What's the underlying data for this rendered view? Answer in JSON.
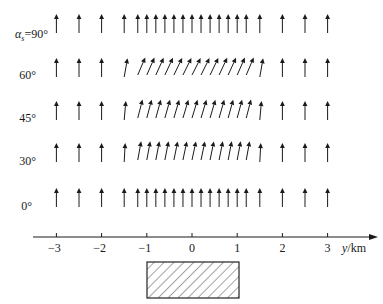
{
  "diagram": {
    "type": "vector-field",
    "colors": {
      "ink": "#1a1a1a",
      "hatch": "#333333",
      "background": "#ffffff"
    },
    "rows": [
      {
        "label_prefix": "α",
        "label_sub": "s",
        "label_value": "=90°",
        "label": "αs=90°",
        "tilt_deg": 0,
        "edge_tilt_deg": 0
      },
      {
        "label": "60°",
        "tilt_deg": 27,
        "edge_tilt_deg": 10
      },
      {
        "label": "45°",
        "tilt_deg": 17,
        "edge_tilt_deg": 5
      },
      {
        "label": "30°",
        "tilt_deg": 12,
        "edge_tilt_deg": 3
      },
      {
        "label": "0°",
        "tilt_deg": 0,
        "edge_tilt_deg": 0
      }
    ],
    "arrow_positions_km": {
      "outer_left": [
        -3,
        -2.5,
        -2,
        -1.5
      ],
      "inner": [
        -1.2,
        -1.0,
        -0.8,
        -0.6,
        -0.4,
        -0.2,
        0,
        0.2,
        0.4,
        0.6,
        0.8,
        1.0,
        1.2
      ],
      "outer_right": [
        1.5,
        2,
        2.5,
        3
      ]
    },
    "x_axis": {
      "ticks": [
        -3,
        -2,
        -1,
        0,
        1,
        2,
        3
      ],
      "tick_labels": [
        "−3",
        "−2",
        "−1",
        "0",
        "1",
        "2",
        "3"
      ],
      "label_var": "y",
      "label_unit": "/km",
      "label": "y/km",
      "range_km": [
        -3.5,
        4.0
      ]
    },
    "source_body": {
      "shape": "hatched-rectangle",
      "y_range_km": [
        -1.0,
        1.0
      ]
    }
  }
}
